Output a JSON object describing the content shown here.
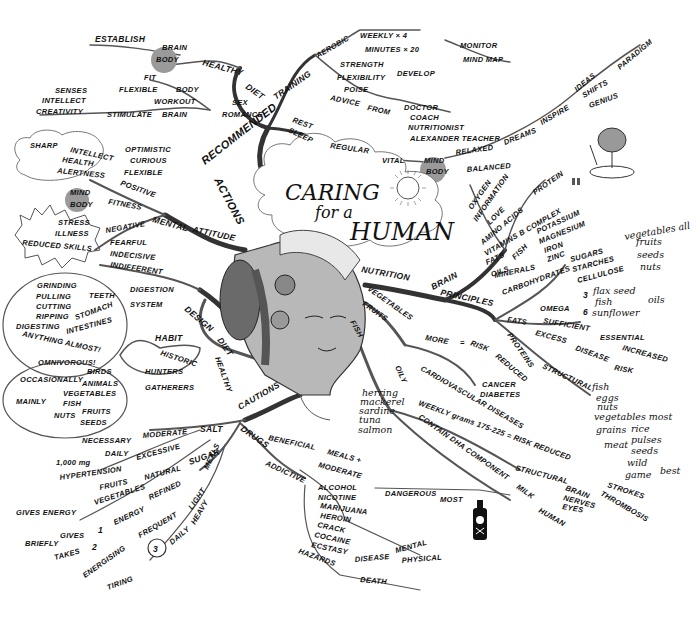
{
  "title": {
    "line1": "CARING",
    "line2": "for a",
    "line3": "HUMAN"
  },
  "center": {
    "image": "woman-head-with-food"
  },
  "branches": {
    "recommended": {
      "label": "RECOMMENDED",
      "diet": {
        "label": "DIET",
        "healthy": "HEALTHY",
        "establish": "ESTABLISH",
        "brain": "BRAIN",
        "body": "BODY"
      },
      "training": {
        "label": "TRAINING",
        "aerobic": "AEROBIC",
        "weekly": "WEEKLY × 4",
        "minutes": "MINUTES × 20",
        "strength": "STRENGTH",
        "flexibility": "FLEXIBILITY",
        "poise": "POISE",
        "develop": "DEVELOP",
        "monitor": "MONITOR",
        "mind_map": "MIND MAP",
        "advice": "ADVICE",
        "from": "FROM",
        "advisors": [
          "DOCTOR",
          "COACH",
          "NUTRITIONIST",
          "ALEXANDER TEACHER"
        ]
      },
      "sex": {
        "sex": "SEX",
        "romance": "ROMANCE",
        "workout": "WORKOUT",
        "body": "BODY",
        "fit": "FIT",
        "flexible": "FLEXIBLE",
        "brain": "BRAIN",
        "stimulate": "STIMULATE",
        "senses": "SENSES",
        "intellect": "INTELLECT",
        "creativity": "CREATIVITY"
      },
      "rest": {
        "rest": "REST",
        "sleep": "SLEEP",
        "regular": "REGULAR",
        "vital": "VITAL",
        "mind": "MIND",
        "body": "BODY",
        "relaxed": "RELAXED",
        "balanced": "BALANCED",
        "dreams": "DREAMS",
        "inspire": "INSPIRE",
        "ideas": "IDEAS",
        "shifts": "SHIFTS",
        "paradigm": "PARADIGM",
        "genius": "GENIUS"
      }
    },
    "actions": {
      "label": "ACTIONS"
    },
    "mental_attitude": {
      "mental": "MENTAL",
      "attitude": "ATTITUDE",
      "positive": "POSITIVE",
      "fitness": "FITNESS",
      "negative": "NEGATIVE",
      "positive_traits": [
        "OPTIMISTIC",
        "CURIOUS",
        "FLEXIBLE"
      ],
      "positive_results": [
        "SHARP",
        "INTELLECT",
        "HEALTH",
        "ALERTNESS"
      ],
      "mind": "MIND",
      "body": "BODY",
      "negative_traits": [
        "FEARFUL",
        "INDECISIVE",
        "INDIFFERENT"
      ],
      "negative_results": [
        "STRESS",
        "ILLNESS",
        "REDUCED SKILLS"
      ]
    },
    "design_diet": {
      "design": "DESIGN",
      "diet": "DIET",
      "healthy": "HEALTHY",
      "digestion": "DIGESTION",
      "system": "SYSTEM",
      "teeth": "TEETH",
      "teeth_actions": [
        "GRINDING",
        "PULLING",
        "CUTTING",
        "RIPPING"
      ],
      "stomach": "STOMACH",
      "intestines": "INTESTINES",
      "digesting": "DIGESTING",
      "anything": "ANYTHING ALMOST!",
      "habit": "HABIT",
      "historic": "HISTORIC",
      "hunters": "HUNTERS",
      "gatherers": "GATHERERS",
      "omnivorous": "OMNIVOROUS!",
      "occasionally": "OCCASIONALLY",
      "birds": "BIRDS",
      "animals": "ANIMALS",
      "mainly": "MAINLY",
      "vegetables": "VEGETABLES",
      "fish": "FISH",
      "nuts": "NUTS",
      "fruits": "FRUITS",
      "seeds": "SEEDS"
    },
    "cautions": {
      "label": "CAUTIONS",
      "salt": "SALT",
      "moderate": "MODERATE",
      "necessary": "NECESSARY",
      "daily": "DAILY",
      "mg": "1,000 mg",
      "excessive": "EXCESSIVE",
      "hypertension": "HYPERTENSION",
      "sugar": "SUGAR",
      "natural": "NATURAL",
      "fruits": "FRUITS",
      "vegetables": "VEGETABLES",
      "gives_energy": "GIVES ENERGY",
      "refined": "REFINED",
      "energy": "ENERGY",
      "briefly": "BRIEFLY",
      "gives": "GIVES",
      "one": "1",
      "takes": "TAKES",
      "two": "2",
      "meals": "MEALS",
      "light": "LIGHT",
      "frequent": "FREQUENT",
      "energising": "ENERGISING",
      "heavy": "HEAVY",
      "daily2": "DAILY",
      "three": "3",
      "tiring": "TIRING",
      "drugs": "DRUGS",
      "beneficial": "BENEFICIAL",
      "meals_plus": "MEALS +",
      "moderate2": "MODERATE",
      "addictive": "ADDICTIVE",
      "substances": [
        "ALCOHOL",
        "NICOTINE",
        "MARIJUANA",
        "HEROIN",
        "CRACK",
        "COCAINE",
        "ECSTASY"
      ],
      "dangerous": "DANGEROUS",
      "most": "MOST",
      "hazards": "HAZARDS",
      "disease": "DISEASE",
      "mental": "MENTAL",
      "physical": "PHYSICAL",
      "death": "DEATH"
    },
    "nutrition": {
      "label": "NUTRITION",
      "brain": "BRAIN",
      "brain_needs": [
        "OXYGEN",
        "INFORMATION",
        "LOVE",
        "AMINO ACIDS",
        "VITAMINS B COMPLEX",
        "FATS",
        "OILS"
      ],
      "protein": "PROTEIN",
      "fish": "FISH",
      "minerals": "MINERALS",
      "mineral_list": [
        "POTASSIUM",
        "MAGNESIUM",
        "IRON",
        "ZINC"
      ],
      "principles": "PRINCIPLES",
      "carbohydrates": "CARBOHYDRATES",
      "carb_types": [
        "SUGARS",
        "STARCHES",
        "CELLULOSE"
      ],
      "carb_sources": [
        "vegetables all",
        "fruits",
        "seeds",
        "nuts"
      ],
      "fats": "FATS",
      "omega": "OMEGA",
      "omega3": "3",
      "omega6": "6",
      "omega_sources": [
        "flax seed",
        "fish",
        "sunflower"
      ],
      "oils": "oils",
      "sufficient": "SUFFICIENT",
      "essential": "ESSENTIAL",
      "excess": "EXCESS",
      "disease": "DISEASE",
      "increased": "INCREASED",
      "risk": "RISK",
      "proteins": "PROTEINS",
      "structural": "STRUCTURAL",
      "protein_sources": [
        "fish",
        "eggs",
        "nuts",
        "vegetables most",
        "grains",
        "meat"
      ],
      "grain_items": [
        "rice",
        "pulses",
        "seeds"
      ],
      "wild": "wild",
      "game": "game",
      "best": "best",
      "vegetables": "VEGETABLES",
      "fruits": "FRUITS",
      "more": "MORE",
      "equals": "=",
      "risk2": "RISK",
      "reduced": "REDUCED",
      "diseases": [
        "CANCER",
        "DIABETES",
        "CARDIOVASCULAR DISEASES"
      ],
      "fish2": "FISH",
      "oily": "OILY",
      "oily_fish": [
        "herring",
        "mackerel",
        "sardine",
        "tuna",
        "salmon"
      ],
      "weekly": "WEEKLY grams 175-225 = RISK REDUCED",
      "reduced_list": [
        "STROKES",
        "THROMBOSIS"
      ],
      "contain": "CONTAIN DHA COMPONENT",
      "structural2": "STRUCTURAL",
      "dha_parts": [
        "BRAIN",
        "NERVES",
        "EYES"
      ],
      "milk": "MILK",
      "human": "HUMAN"
    }
  }
}
